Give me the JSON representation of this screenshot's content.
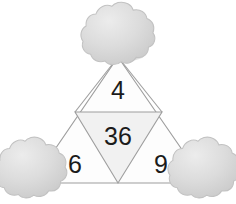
{
  "scene": {
    "title": "Triangle number puzzle with trees",
    "background_color": "#ffffff",
    "width": 236,
    "height": 204
  },
  "puzzle": {
    "shape": "equilateral-triangle-subdivided",
    "outline_color": "#9a9a9a",
    "outer_fill": "#fdfdfd",
    "inner_fill": "#f2f2f2",
    "numbers": {
      "top": "4",
      "center": "36",
      "bottom_left": "6",
      "bottom_right": "9"
    },
    "number_color": "#1b1b1b"
  },
  "trees": [
    {
      "position": "top",
      "canopy_color": "#d6d6d6",
      "canopy_highlight": "#e6e6e6",
      "trunk_color": "#8a8179",
      "shadow_color": "#b8b8b8"
    },
    {
      "position": "bottom-left",
      "canopy_color": "#d6d6d6",
      "canopy_highlight": "#e6e6e6",
      "trunk_color": "#8a8179",
      "shadow_color": "#b8b8b8"
    },
    {
      "position": "bottom-right",
      "canopy_color": "#d6d6d6",
      "canopy_highlight": "#e6e6e6",
      "trunk_color": "#8a8179",
      "shadow_color": "#b8b8b8"
    }
  ]
}
